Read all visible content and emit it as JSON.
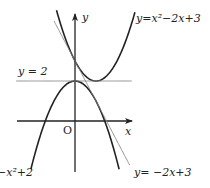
{
  "chart_data": {
    "type": "line",
    "title": "",
    "xlabel": "x",
    "ylabel": "y",
    "origin_label": "O",
    "xlim": [
      -2.9,
      2.7
    ],
    "ylim": [
      -2.5,
      5.4
    ],
    "grid": false,
    "series": [
      {
        "name": "upper-parabola",
        "label": "y=x²−2x+3",
        "expr": "x^2-2x+3",
        "coef": [
          1,
          -2,
          3
        ],
        "xrange": [
          -0.88,
          2.95
        ],
        "stroke": "#222222",
        "weight": "bold"
      },
      {
        "name": "lower-parabola",
        "label": "−x²+2",
        "expr": "-x^2+2",
        "coef": [
          -1,
          0,
          2
        ],
        "xrange": [
          -2.1,
          2.1
        ],
        "stroke": "#222222",
        "weight": "bold"
      },
      {
        "name": "tangent-line",
        "label": "y= −2x+3",
        "expr": "-2x+3",
        "coef": [
          0,
          -2,
          3
        ],
        "xrange": [
          -1.0,
          2.6
        ],
        "stroke": "#888888",
        "weight": "thin"
      },
      {
        "name": "horizontal-line",
        "label": "y = 2",
        "expr": "2",
        "coef": [
          0,
          0,
          2
        ],
        "xrange": [
          -2.8,
          2.7
        ],
        "stroke": "#888888",
        "weight": "thin"
      }
    ]
  }
}
